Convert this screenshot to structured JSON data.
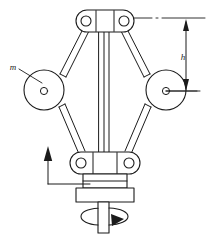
{
  "figure": {
    "labels": {
      "mass": "m",
      "height": "h"
    },
    "colors": {
      "line": "#1b1b1b",
      "fill": "#ffffff",
      "background": "#ffffff",
      "arrow": "#1b1b1b"
    },
    "annotations": {
      "sleeve_motion_arrow": "up-arrow",
      "shaft_rotation_arrow": "rotation-arrow",
      "height_dimension_arrow": "double-headed-vertical-arrow"
    },
    "parts": {
      "top_hub": "top-pivot-hub",
      "bottom_hub": "sleeve-pivot-hub",
      "left_ball": "left-flyball-mass",
      "right_ball": "right-flyball-mass",
      "upper_left_arm": "upper-left-link",
      "upper_right_arm": "upper-right-link",
      "lower_left_arm": "lower-left-link",
      "lower_right_arm": "lower-right-link",
      "center_rod": "center-spindle-rod",
      "collar": "sleeve-collar",
      "flange": "sleeve-flange",
      "shaft": "drive-shaft"
    }
  }
}
